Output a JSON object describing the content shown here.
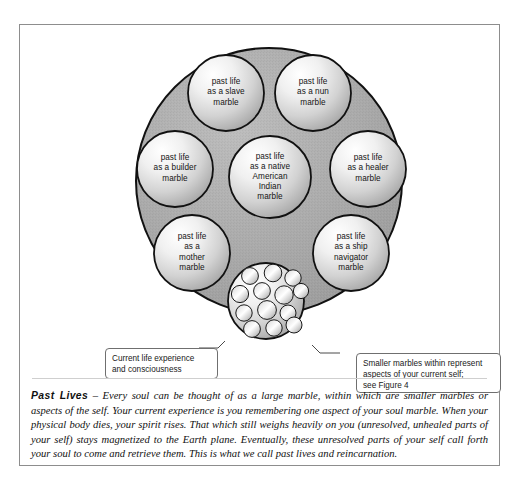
{
  "figure": {
    "title_term": "Past Lives",
    "caption_dash": " – ",
    "caption_body": "Every soul can be thought of as a large marble, within which are smaller marbles or aspects of the self. Your current experience is you remembering one aspect of your soul marble. When your physical body dies, your spirit rises. That which still weighs heavily on you (unresolved, unhealed parts of your self) stays magnetized to the Earth plane. Eventually, these unresolved parts of your self call forth your soul to come and retrieve them. This is what we call past lives and reincarnation."
  },
  "colors": {
    "soul_marble_fill": "#a8a8a8",
    "soul_marble_stroke": "#111111",
    "past_life_marble_light": "#ffffff",
    "past_life_marble_mid": "#d6d6d6",
    "past_life_marble_dark": "#8f8f8f",
    "leader_line_inner": "#ffffff",
    "leader_line_outer": "#4a4a4a",
    "frame_border": "#8d8d8d",
    "text": "#141414"
  },
  "soul_marble": {
    "name": "soul-marble",
    "center_x": 249,
    "center_y": 156,
    "radius": 133
  },
  "past_life_marbles": [
    {
      "id": "slave",
      "label": "past life\nas a slave\nmarble",
      "cx": 206,
      "cy": 68,
      "r": 38
    },
    {
      "id": "nun",
      "label": "past life\nas a nun\nmarble",
      "cx": 293,
      "cy": 68,
      "r": 38
    },
    {
      "id": "builder",
      "label": "past life\nas a builder\nmarble",
      "cx": 155,
      "cy": 144,
      "r": 38
    },
    {
      "id": "healer",
      "label": "past life\nas a healer\nmarble",
      "cx": 348,
      "cy": 144,
      "r": 38
    },
    {
      "id": "native",
      "label": "past life\nas a native\nAmerican\nIndian\nmarble",
      "cx": 250,
      "cy": 152,
      "r": 41
    },
    {
      "id": "mother",
      "label": "past life\nas a\nmother\nmarble",
      "cx": 172,
      "cy": 228,
      "r": 38
    },
    {
      "id": "navigator",
      "label": "past life\nas a ship\nnavigator\nmarble",
      "cx": 331,
      "cy": 228,
      "r": 38
    }
  ],
  "aspect_cluster": {
    "name": "aspect-marble-cluster",
    "cx": 246,
    "cy": 276,
    "r": 38,
    "marble_count": 13,
    "marbles": [
      {
        "cx": 230,
        "cy": 251,
        "r": 8.4
      },
      {
        "cx": 253,
        "cy": 248,
        "r": 8.8
      },
      {
        "cx": 273,
        "cy": 253,
        "r": 8.2
      },
      {
        "cx": 220,
        "cy": 269,
        "r": 8.6
      },
      {
        "cx": 242,
        "cy": 266,
        "r": 8.4
      },
      {
        "cx": 264,
        "cy": 270,
        "r": 9.2
      },
      {
        "cx": 281,
        "cy": 266,
        "r": 7.6
      },
      {
        "cx": 224,
        "cy": 288,
        "r": 8.2
      },
      {
        "cx": 247,
        "cy": 285,
        "r": 9.4
      },
      {
        "cx": 268,
        "cy": 288,
        "r": 8.0
      },
      {
        "cx": 232,
        "cy": 304,
        "r": 8.4
      },
      {
        "cx": 254,
        "cy": 303,
        "r": 8.2
      },
      {
        "cx": 274,
        "cy": 300,
        "r": 8.0
      }
    ]
  },
  "callouts": [
    {
      "id": "current-life",
      "name": "callout-current-life",
      "text": "Current life experience\nand consciousness"
    },
    {
      "id": "smaller-marbles",
      "name": "callout-smaller-marbles",
      "text": "Smaller marbles within represent\naspects of your current self;\nsee Figure 4"
    }
  ],
  "leader_lines": [
    {
      "id": "left-leader",
      "x1": 222,
      "y1": 298,
      "x2": 198,
      "y2": 323,
      "x3": 179,
      "y3": 323
    },
    {
      "id": "right-leader",
      "x1": 272,
      "y1": 298,
      "x2": 300,
      "y2": 328,
      "x3": 320,
      "y3": 328
    }
  ]
}
